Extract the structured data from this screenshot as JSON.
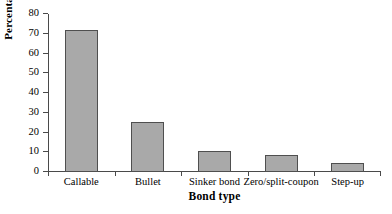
{
  "chart_data": {
    "type": "bar",
    "title": "",
    "xlabel": "Bond type",
    "ylabel": "Percentage",
    "categories": [
      "Callable",
      "Bullet",
      "Sinker bond",
      "Zero/split-coupon",
      "Step-up"
    ],
    "values": [
      72,
      25.3,
      10.8,
      8.5,
      4.8
    ],
    "ylim": [
      0,
      80
    ],
    "ytick_labels": [
      "0",
      "10",
      "20",
      "30",
      "40",
      "50",
      "60",
      "70",
      "80"
    ],
    "ytick_values": [
      0,
      10,
      20,
      30,
      40,
      50,
      60,
      70,
      80
    ],
    "grid": false,
    "legend": null,
    "bar_color": "#a9a9a9",
    "bar_edge_color": "#4f4f4f",
    "axis_color": "#4a4a4a",
    "background_color": "#ffffff"
  }
}
